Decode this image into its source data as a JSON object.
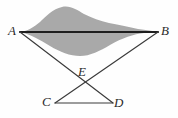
{
  "figure": {
    "type": "geometry-diagram",
    "background_color": "#fefefe",
    "shaded_region": {
      "name": "shaded-blob",
      "fill_color": "#a9a9a9",
      "top_outline": "M 20 32 C 30 30 36 24 44 18 C 52 11 58 6 66 6 C 74 6 80 12 88 16 C 96 20 104 22 112 24 C 122 26 136 29 158 32 Z",
      "bottom_outline": "M 20 32 C 34 34 44 42 54 48 C 64 54 74 56 84 55 C 96 54 108 48 120 42 C 134 36 148 33 158 32 Z"
    },
    "segments": [
      {
        "name": "segment-AB",
        "from": "A",
        "to": "B",
        "x1": 20,
        "y1": 32,
        "x2": 158,
        "y2": 32,
        "stroke": "#1e1e1e",
        "width": 2.1
      },
      {
        "name": "segment-AD",
        "from": "A",
        "to": "D",
        "x1": 20,
        "y1": 32,
        "x2": 113,
        "y2": 103,
        "stroke": "#3a3a3a",
        "width": 1.1
      },
      {
        "name": "segment-BC",
        "from": "B",
        "to": "C",
        "x1": 158,
        "y1": 32,
        "x2": 55,
        "y2": 103,
        "stroke": "#3a3a3a",
        "width": 1.1
      },
      {
        "name": "segment-CD",
        "from": "C",
        "to": "D",
        "x1": 55,
        "y1": 103,
        "x2": 113,
        "y2": 103,
        "stroke": "#3a3a3a",
        "width": 1.1
      }
    ],
    "points": [
      {
        "name": "point-A",
        "label": "A",
        "x": 20,
        "y": 32
      },
      {
        "name": "point-B",
        "label": "B",
        "x": 158,
        "y": 32
      },
      {
        "name": "point-C",
        "label": "C",
        "x": 55,
        "y": 103
      },
      {
        "name": "point-D",
        "label": "D",
        "x": 113,
        "y": 103
      },
      {
        "name": "point-E",
        "label": "E",
        "x": 85,
        "y": 86
      }
    ],
    "labels": {
      "A": "A",
      "B": "B",
      "C": "C",
      "D": "D",
      "E": "E"
    }
  }
}
